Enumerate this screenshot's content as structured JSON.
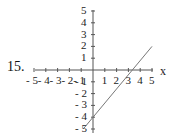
{
  "problem_number": "15.",
  "chart_data": {
    "type": "line",
    "title": "",
    "xlabel": "x",
    "ylabel": "",
    "xlim": [
      -5,
      5
    ],
    "ylim": [
      -5,
      5
    ],
    "x_ticks": [
      "-5",
      "-4",
      "-3",
      "-2",
      "-1",
      "1",
      "2",
      "3",
      "4",
      "5"
    ],
    "y_ticks": [
      "5",
      "4",
      "3",
      "2",
      "1",
      "-1",
      "-2",
      "-3",
      "-4",
      "-5"
    ],
    "grid": false,
    "series": [
      {
        "name": "line",
        "x": [
          -0.83,
          0,
          3.33,
          5
        ],
        "y": [
          -5,
          -4,
          0,
          2
        ]
      }
    ],
    "annotations": [
      "y-intercept at -4",
      "x-intercept near 3.3"
    ]
  }
}
